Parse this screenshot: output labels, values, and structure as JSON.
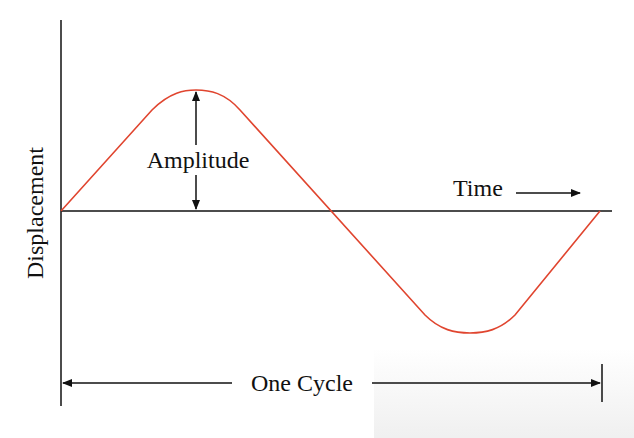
{
  "diagram": {
    "labels": {
      "y_axis": "Displacement",
      "amplitude": "Amplitude",
      "time": "Time",
      "cycle": "One Cycle"
    },
    "colors": {
      "wave": "#e0452f",
      "axes": "#111111"
    },
    "wave": {
      "type": "sine",
      "cycles": 1,
      "start_phase": "zero-crossing rising"
    }
  }
}
